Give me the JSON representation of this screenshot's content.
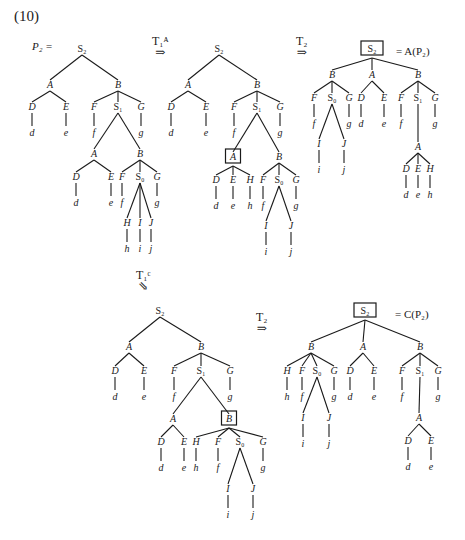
{
  "figure": {
    "number": "(10)",
    "p2_label": "P₂ =",
    "result_a": "= A(P₂)",
    "result_c": "= C(P₂)"
  },
  "transforms": [
    {
      "id": "t1a",
      "label": "T₁ᴬ",
      "arrow": "⇒",
      "x": 152,
      "y": 36
    },
    {
      "id": "t2a",
      "label": "T₂",
      "arrow": "⇒",
      "x": 296,
      "y": 36
    },
    {
      "id": "t1c",
      "label": "T₁ᶜ",
      "arrow": "⇘",
      "x": 136,
      "y": 270
    },
    {
      "id": "t2c",
      "label": "T₂",
      "arrow": "⇒",
      "x": 256,
      "y": 312
    }
  ],
  "trees": [
    {
      "name": "tree-p2",
      "nodes": [
        {
          "id": "r",
          "label": "S₂",
          "x": 82,
          "y": 52,
          "roman": true
        },
        {
          "id": "A",
          "label": "A",
          "x": 50,
          "y": 88,
          "parent": "r"
        },
        {
          "id": "B",
          "label": "B",
          "x": 118,
          "y": 88,
          "parent": "r"
        },
        {
          "id": "D",
          "label": "D",
          "x": 32,
          "y": 110,
          "parent": "A",
          "leaf": "d"
        },
        {
          "id": "E",
          "label": "E",
          "x": 66,
          "y": 110,
          "parent": "A",
          "leaf": "e"
        },
        {
          "id": "F",
          "label": "F",
          "x": 94,
          "y": 110,
          "parent": "B",
          "leaf": "f"
        },
        {
          "id": "S1",
          "label": "S₁",
          "x": 118,
          "y": 110,
          "parent": "B",
          "roman": true
        },
        {
          "id": "G",
          "label": "G",
          "x": 141,
          "y": 110,
          "parent": "B",
          "leaf": "g"
        },
        {
          "id": "A2",
          "label": "A",
          "x": 94,
          "y": 157,
          "parent": "S1"
        },
        {
          "id": "B2",
          "label": "B",
          "x": 140,
          "y": 157,
          "parent": "S1"
        },
        {
          "id": "D2",
          "label": "D",
          "x": 76,
          "y": 180,
          "parent": "A2",
          "leaf": "d"
        },
        {
          "id": "E2",
          "label": "E",
          "x": 111,
          "y": 180,
          "parent": "A2",
          "leaf": "e"
        },
        {
          "id": "F2",
          "label": "F",
          "x": 122,
          "y": 180,
          "parent": "B2",
          "leaf": "f"
        },
        {
          "id": "S0",
          "label": "S₀",
          "x": 140,
          "y": 180,
          "parent": "B2",
          "roman": true
        },
        {
          "id": "G2",
          "label": "G",
          "x": 157,
          "y": 180,
          "parent": "B2",
          "leaf": "g"
        },
        {
          "id": "H",
          "label": "H",
          "x": 127,
          "y": 226,
          "parent": "S0",
          "leaf": "h"
        },
        {
          "id": "I",
          "label": "I",
          "x": 140,
          "y": 226,
          "parent": "S0",
          "leaf": "i"
        },
        {
          "id": "J",
          "label": "J",
          "x": 151,
          "y": 226,
          "parent": "S0",
          "leaf": "j"
        }
      ]
    },
    {
      "name": "tree-t1a",
      "nodes": [
        {
          "id": "r",
          "label": "S₂",
          "x": 219,
          "y": 52,
          "roman": true
        },
        {
          "id": "A",
          "label": "A",
          "x": 188,
          "y": 88,
          "parent": "r"
        },
        {
          "id": "B",
          "label": "B",
          "x": 257,
          "y": 88,
          "parent": "r"
        },
        {
          "id": "D",
          "label": "D",
          "x": 171,
          "y": 110,
          "parent": "A",
          "leaf": "d"
        },
        {
          "id": "E",
          "label": "E",
          "x": 206,
          "y": 110,
          "parent": "A",
          "leaf": "e"
        },
        {
          "id": "F",
          "label": "F",
          "x": 234,
          "y": 110,
          "parent": "B",
          "leaf": "f"
        },
        {
          "id": "S1",
          "label": "S₁",
          "x": 257,
          "y": 110,
          "roman": true,
          "parent": "B"
        },
        {
          "id": "G",
          "label": "G",
          "x": 280,
          "y": 110,
          "parent": "B",
          "leaf": "g"
        },
        {
          "id": "A2",
          "label": "A",
          "x": 233,
          "y": 160,
          "parent": "S1",
          "boxed": true
        },
        {
          "id": "B2",
          "label": "B",
          "x": 279,
          "y": 160,
          "parent": "S1"
        },
        {
          "id": "D2",
          "label": "D",
          "x": 216,
          "y": 183,
          "parent": "A2",
          "leaf": "d"
        },
        {
          "id": "E2",
          "label": "E",
          "x": 233,
          "y": 183,
          "parent": "A2",
          "leaf": "e"
        },
        {
          "id": "H2",
          "label": "H",
          "x": 250,
          "y": 183,
          "parent": "A2",
          "leaf": "h"
        },
        {
          "id": "F2",
          "label": "F",
          "x": 263,
          "y": 183,
          "parent": "B2",
          "leaf": "f"
        },
        {
          "id": "S0",
          "label": "S₀",
          "x": 279,
          "y": 183,
          "roman": true,
          "parent": "B2"
        },
        {
          "id": "G2",
          "label": "G",
          "x": 296,
          "y": 183,
          "parent": "B2",
          "leaf": "g"
        },
        {
          "id": "I",
          "label": "I",
          "x": 266,
          "y": 229,
          "parent": "S0",
          "leaf": "i"
        },
        {
          "id": "J",
          "label": "J",
          "x": 291,
          "y": 229,
          "parent": "S0",
          "leaf": "j"
        }
      ]
    },
    {
      "name": "tree-a-p2",
      "nodes": [
        {
          "id": "r",
          "label": "S₂",
          "x": 372,
          "y": 52,
          "roman": true,
          "boxed": true
        },
        {
          "id": "B1",
          "label": "B",
          "x": 332,
          "y": 78,
          "parent": "r"
        },
        {
          "id": "A",
          "label": "A",
          "x": 372,
          "y": 78,
          "parent": "r"
        },
        {
          "id": "B2",
          "label": "B",
          "x": 418,
          "y": 78,
          "parent": "r"
        },
        {
          "id": "F1",
          "label": "F",
          "x": 314,
          "y": 101,
          "parent": "B1",
          "leaf": "f"
        },
        {
          "id": "S0",
          "label": "S₀",
          "x": 332,
          "y": 101,
          "roman": true,
          "parent": "B1"
        },
        {
          "id": "G1",
          "label": "G",
          "x": 349,
          "y": 101,
          "parent": "B1",
          "leaf": "g"
        },
        {
          "id": "D",
          "label": "D",
          "x": 361,
          "y": 101,
          "parent": "A",
          "leaf": "d"
        },
        {
          "id": "E",
          "label": "E",
          "x": 384,
          "y": 101,
          "parent": "A",
          "leaf": "e"
        },
        {
          "id": "F2",
          "label": "F",
          "x": 401,
          "y": 101,
          "parent": "B2",
          "leaf": "f"
        },
        {
          "id": "S1",
          "label": "S₁",
          "x": 418,
          "y": 101,
          "roman": true,
          "parent": "B2"
        },
        {
          "id": "G2",
          "label": "G",
          "x": 435,
          "y": 101,
          "parent": "B2",
          "leaf": "g"
        },
        {
          "id": "I",
          "label": "I",
          "x": 319,
          "y": 147,
          "parent": "S0",
          "leaf": "i"
        },
        {
          "id": "J",
          "label": "J",
          "x": 344,
          "y": 147,
          "parent": "S0",
          "leaf": "j"
        },
        {
          "id": "A3",
          "label": "A",
          "x": 418,
          "y": 150,
          "parent": "S1"
        },
        {
          "id": "D3",
          "label": "D",
          "x": 406,
          "y": 172,
          "parent": "A3",
          "leaf": "d"
        },
        {
          "id": "E3",
          "label": "E",
          "x": 418,
          "y": 172,
          "parent": "A3",
          "leaf": "e"
        },
        {
          "id": "H3",
          "label": "H",
          "x": 430,
          "y": 172,
          "parent": "A3",
          "leaf": "h"
        }
      ]
    },
    {
      "name": "tree-t1c",
      "nodes": [
        {
          "id": "r",
          "label": "S₂",
          "x": 160,
          "y": 314,
          "roman": true
        },
        {
          "id": "A",
          "label": "A",
          "x": 129,
          "y": 350,
          "parent": "r"
        },
        {
          "id": "B",
          "label": "B",
          "x": 201,
          "y": 350,
          "parent": "r"
        },
        {
          "id": "D",
          "label": "D",
          "x": 115,
          "y": 374,
          "parent": "A",
          "leaf": "d"
        },
        {
          "id": "E",
          "label": "E",
          "x": 144,
          "y": 374,
          "parent": "A",
          "leaf": "e"
        },
        {
          "id": "F",
          "label": "F",
          "x": 174,
          "y": 374,
          "parent": "B",
          "leaf": "f"
        },
        {
          "id": "S1",
          "label": "S₁",
          "x": 201,
          "y": 374,
          "roman": true,
          "parent": "B"
        },
        {
          "id": "G",
          "label": "G",
          "x": 230,
          "y": 374,
          "parent": "B",
          "leaf": "g"
        },
        {
          "id": "A2",
          "label": "A",
          "x": 173,
          "y": 422,
          "parent": "S1"
        },
        {
          "id": "B2",
          "label": "B",
          "x": 229,
          "y": 422,
          "parent": "S1",
          "boxed": true
        },
        {
          "id": "D2",
          "label": "D",
          "x": 161,
          "y": 445,
          "parent": "A2",
          "leaf": "d"
        },
        {
          "id": "E2",
          "label": "E",
          "x": 184,
          "y": 445,
          "parent": "A2",
          "leaf": "e"
        },
        {
          "id": "H2",
          "label": "H",
          "x": 196,
          "y": 445,
          "parent": "B2",
          "leaf": "h"
        },
        {
          "id": "F2",
          "label": "F",
          "x": 218,
          "y": 445,
          "parent": "B2",
          "leaf": "f"
        },
        {
          "id": "S0",
          "label": "S₀",
          "x": 240,
          "y": 445,
          "roman": true,
          "parent": "B2"
        },
        {
          "id": "G2",
          "label": "G",
          "x": 263,
          "y": 445,
          "parent": "B2",
          "leaf": "g"
        },
        {
          "id": "I",
          "label": "I",
          "x": 228,
          "y": 492,
          "parent": "S0",
          "leaf": "i"
        },
        {
          "id": "J",
          "label": "J",
          "x": 253,
          "y": 492,
          "parent": "S0",
          "leaf": "j"
        }
      ]
    },
    {
      "name": "tree-c-p2",
      "nodes": [
        {
          "id": "r",
          "label": "S₂",
          "x": 365,
          "y": 314,
          "roman": true,
          "boxed": true
        },
        {
          "id": "B1",
          "label": "B",
          "x": 311,
          "y": 350,
          "parent": "r"
        },
        {
          "id": "A",
          "label": "A",
          "x": 363,
          "y": 350,
          "parent": "r"
        },
        {
          "id": "B2",
          "label": "B",
          "x": 420,
          "y": 350,
          "parent": "r"
        },
        {
          "id": "H1",
          "label": "H",
          "x": 287,
          "y": 374,
          "parent": "B1",
          "leaf": "h"
        },
        {
          "id": "F1",
          "label": "F",
          "x": 302,
          "y": 374,
          "parent": "B1",
          "leaf": "f"
        },
        {
          "id": "S0",
          "label": "S₀",
          "x": 317,
          "y": 374,
          "roman": true,
          "parent": "B1"
        },
        {
          "id": "G1",
          "label": "G",
          "x": 334,
          "y": 374,
          "parent": "B1",
          "leaf": "g"
        },
        {
          "id": "D",
          "label": "D",
          "x": 350,
          "y": 374,
          "parent": "A",
          "leaf": "d"
        },
        {
          "id": "E",
          "label": "E",
          "x": 374,
          "y": 374,
          "parent": "A",
          "leaf": "e"
        },
        {
          "id": "F2",
          "label": "F",
          "x": 402,
          "y": 374,
          "parent": "B2",
          "leaf": "f"
        },
        {
          "id": "S1",
          "label": "S₁",
          "x": 420,
          "y": 374,
          "roman": true,
          "parent": "B2"
        },
        {
          "id": "G2",
          "label": "G",
          "x": 438,
          "y": 374,
          "parent": "B2",
          "leaf": "g"
        },
        {
          "id": "I",
          "label": "I",
          "x": 303,
          "y": 421,
          "parent": "S0",
          "leaf": "i"
        },
        {
          "id": "J",
          "label": "J",
          "x": 329,
          "y": 421,
          "parent": "S0",
          "leaf": "j"
        },
        {
          "id": "A3",
          "label": "A",
          "x": 419,
          "y": 421,
          "parent": "S1"
        },
        {
          "id": "D3",
          "label": "D",
          "x": 408,
          "y": 444,
          "parent": "A3",
          "leaf": "d"
        },
        {
          "id": "E3",
          "label": "E",
          "x": 431,
          "y": 444,
          "parent": "A3",
          "leaf": "e"
        }
      ]
    }
  ]
}
